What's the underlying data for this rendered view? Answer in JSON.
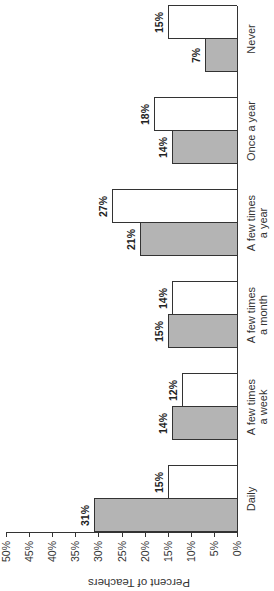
{
  "chart_data": {
    "type": "bar",
    "orientation": "rotated 90 degrees counter-clockwise (vertical bar chart displayed sideways)",
    "title": "",
    "xlabel": "",
    "ylabel": "Percent of Teachers",
    "ylim": [
      0,
      50
    ],
    "yticks": [
      "0%",
      "5%",
      "10%",
      "15%",
      "20%",
      "25%",
      "30%",
      "35%",
      "40%",
      "45%",
      "50%"
    ],
    "categories": [
      "Daily",
      "A few times a week",
      "A few times a month",
      "A few times a year",
      "Once a year",
      "Never"
    ],
    "category_lines": [
      [
        "Daily"
      ],
      [
        "A few times",
        "a week"
      ],
      [
        "A few times",
        "a month"
      ],
      [
        "A few times",
        "a year"
      ],
      [
        "Once a year"
      ],
      [
        "Never"
      ]
    ],
    "series": [
      {
        "name": "Series 1 (gray)",
        "color": "#b4b4b4",
        "values": [
          31,
          14,
          15,
          21,
          14,
          7
        ],
        "labels": [
          "31%",
          "14%",
          "15%",
          "21%",
          "14%",
          "7%"
        ]
      },
      {
        "name": "Series 2 (white)",
        "color": "#ffffff",
        "values": [
          15,
          12,
          14,
          27,
          18,
          15
        ],
        "labels": [
          "15%",
          "12%",
          "14%",
          "27%",
          "18%",
          "15%"
        ]
      }
    ],
    "legend": "none visible",
    "grid": false
  }
}
